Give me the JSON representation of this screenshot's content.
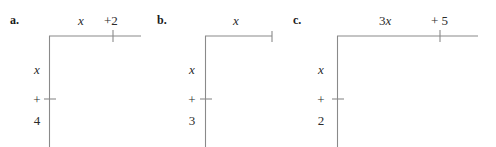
{
  "figure": {
    "type": "algebra-area-model-diagrams",
    "background_color": "#ffffff",
    "line_color": "#8a8a8a",
    "text_color": "#2b2b2b",
    "panels": [
      {
        "letter": "a.",
        "top_labels": [
          {
            "text": "x",
            "style": "italic"
          },
          {
            "text": "+2",
            "style": "upright"
          }
        ],
        "side_labels": [
          {
            "text": "x",
            "style": "italic"
          },
          {
            "text": "+",
            "style": "upright"
          },
          {
            "text": "4",
            "style": "upright"
          }
        ],
        "top_expression": "x + 2",
        "side_expression": "x + 4",
        "top_tick_present": true,
        "top_end_tick": false,
        "side_tick_present": true
      },
      {
        "letter": "b.",
        "top_labels": [
          {
            "text": "x",
            "style": "italic"
          }
        ],
        "side_labels": [
          {
            "text": "x",
            "style": "italic"
          },
          {
            "text": "+",
            "style": "upright"
          },
          {
            "text": "3",
            "style": "upright"
          }
        ],
        "top_expression": "x",
        "side_expression": "x + 3",
        "top_tick_present": false,
        "top_end_tick": true,
        "side_tick_present": true
      },
      {
        "letter": "c.",
        "top_labels": [
          {
            "text": "3x",
            "style": "mixed"
          },
          {
            "text": "+ 5",
            "style": "upright"
          }
        ],
        "side_labels": [
          {
            "text": "x",
            "style": "italic"
          },
          {
            "text": "+",
            "style": "upright"
          },
          {
            "text": "2",
            "style": "upright"
          }
        ],
        "top_expression": "3x + 5",
        "side_expression": "x + 2",
        "top_tick_present": true,
        "top_end_tick": false,
        "side_tick_present": true
      }
    ]
  }
}
